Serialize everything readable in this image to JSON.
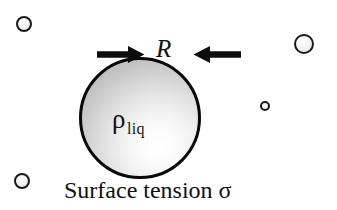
{
  "figure": {
    "background_color": "#ffffff",
    "width": 337,
    "height": 210,
    "ink_color": "#111111"
  },
  "droplet": {
    "name": "liquid-droplet",
    "density_symbol": "ρ",
    "density_subscript": "liq",
    "outline_color": "#080808",
    "fill_light": "#ffffff",
    "fill_dark": "#ababab",
    "center_x": 140,
    "center_y": 118,
    "radius": 61
  },
  "radius_annotation": {
    "label": "R",
    "left_arrow": "arrow-right",
    "right_arrow": "arrow-left",
    "arrow_color": "#0d0d0d"
  },
  "caption": {
    "text": "Surface tension σ"
  },
  "molecules": [
    {
      "name": "molecule-top-left",
      "x": 24,
      "y": 24,
      "d": 16
    },
    {
      "name": "molecule-top-right",
      "x": 304,
      "y": 44,
      "d": 20
    },
    {
      "name": "molecule-middle-right",
      "x": 265,
      "y": 106,
      "d": 10
    },
    {
      "name": "molecule-bottom-left",
      "x": 22,
      "y": 181,
      "d": 16
    }
  ]
}
